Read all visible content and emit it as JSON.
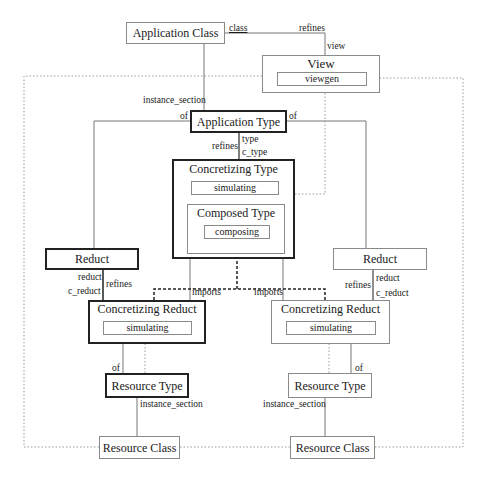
{
  "diagram": {
    "boxes": {
      "application_class": {
        "label": "Application Class"
      },
      "view": {
        "label": "View",
        "inner": "viewgen"
      },
      "application_type": {
        "label": "Application Type"
      },
      "concretizing_type": {
        "label": "Concretizing Type",
        "inner": "simulating"
      },
      "composed_type": {
        "label": "Composed Type",
        "inner": "composing"
      },
      "reduct_left": {
        "label": "Reduct"
      },
      "reduct_right": {
        "label": "Reduct"
      },
      "concretizing_reduct_left": {
        "label": "Concretizing Reduct",
        "inner": "simulating"
      },
      "concretizing_reduct_right": {
        "label": "Concretizing Reduct",
        "inner": "simulating"
      },
      "resource_type_left": {
        "label": "Resource Type"
      },
      "resource_type_right": {
        "label": "Resource Type"
      },
      "resource_class_left": {
        "label": "Resource Class"
      },
      "resource_class_right": {
        "label": "Resource Class"
      }
    },
    "edge_labels": {
      "class": "class",
      "refines_top": "refines",
      "view": "view",
      "instance_section_top": "instance_section",
      "of_left": "of",
      "of_right": "of",
      "refines_mid": "refines",
      "type": "type",
      "c_type": "c_type",
      "reduct_left": "reduct",
      "c_reduct_left": "c_reduct",
      "refines_left": "refines",
      "reduct_right": "reduct",
      "c_reduct_right": "c_reduct",
      "refines_right": "refines",
      "imports_left": "imports",
      "imports_right": "imports",
      "of_bottom_left": "of",
      "of_bottom_right": "of",
      "instance_section_left": "instance_section",
      "instance_section_right": "instance_section"
    }
  }
}
